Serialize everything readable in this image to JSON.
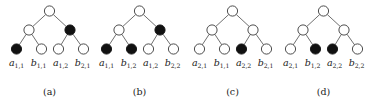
{
  "figure": {
    "name": "four-binary-trees-figure",
    "background_color": "#ffffff",
    "node_stroke_color": "#3a3a3a",
    "node_white_fill": "#ffffff",
    "node_black_fill": "#111111",
    "edge_color": "#555555",
    "text_color": "#1a1a1a"
  },
  "trees": [
    {
      "caption": "(a)",
      "nodes": {
        "root": "white",
        "internal_left": "white",
        "internal_right": "black",
        "leaves": [
          "black",
          "white",
          "white",
          "white"
        ]
      },
      "leaf_labels": [
        {
          "base": "a",
          "sub": "1,1"
        },
        {
          "base": "b",
          "sub": "1,1"
        },
        {
          "base": "a",
          "sub": "1,2"
        },
        {
          "base": "b",
          "sub": "2,1"
        }
      ]
    },
    {
      "caption": "(b)",
      "nodes": {
        "root": "white",
        "internal_left": "white",
        "internal_right": "black",
        "leaves": [
          "black",
          "black",
          "white",
          "white"
        ]
      },
      "leaf_labels": [
        {
          "base": "a",
          "sub": "1,1"
        },
        {
          "base": "b",
          "sub": "1,2"
        },
        {
          "base": "a",
          "sub": "1,2"
        },
        {
          "base": "b",
          "sub": "2,2"
        }
      ]
    },
    {
      "caption": "(c)",
      "nodes": {
        "root": "white",
        "internal_left": "white",
        "internal_right": "white",
        "leaves": [
          "white",
          "white",
          "black",
          "white"
        ]
      },
      "leaf_labels": [
        {
          "base": "a",
          "sub": "2,1"
        },
        {
          "base": "b",
          "sub": "1,1"
        },
        {
          "base": "a",
          "sub": "2,2"
        },
        {
          "base": "b",
          "sub": "2,1"
        }
      ]
    },
    {
      "caption": "(d)",
      "nodes": {
        "root": "white",
        "internal_left": "white",
        "internal_right": "white",
        "leaves": [
          "white",
          "black",
          "black",
          "white"
        ]
      },
      "leaf_labels": [
        {
          "base": "a",
          "sub": "2,1"
        },
        {
          "base": "b",
          "sub": "1,2"
        },
        {
          "base": "a",
          "sub": "2,2"
        },
        {
          "base": "b",
          "sub": "2,2"
        }
      ]
    }
  ]
}
